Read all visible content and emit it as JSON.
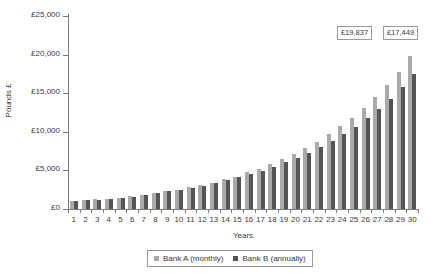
{
  "chart_data": {
    "type": "bar",
    "title": "",
    "xlabel": "Years",
    "ylabel": "Pounds £",
    "ylim": [
      0,
      25000
    ],
    "grid": false,
    "legend_position": "bottom",
    "ytick_labels": [
      "£25,000",
      "£20,000",
      "£15,000",
      "£10,000",
      "£5,000",
      "£0"
    ],
    "ytick_values": [
      25000,
      20000,
      15000,
      10000,
      5000,
      0
    ],
    "categories": [
      "1",
      "2",
      "3",
      "4",
      "5",
      "6",
      "7",
      "8",
      "9",
      "10",
      "11",
      "12",
      "13",
      "14",
      "15",
      "16",
      "17",
      "18",
      "19",
      "20",
      "21",
      "22",
      "23",
      "24",
      "25",
      "26",
      "27",
      "28",
      "29",
      "30"
    ],
    "series": [
      {
        "name": "Bank A (monthly)",
        "color": "#aaaaaa",
        "values": [
          1050,
          1130,
          1250,
          1310,
          1470,
          1650,
          1880,
          2100,
          2330,
          2520,
          2800,
          3080,
          3420,
          3880,
          4180,
          4750,
          5150,
          5800,
          6450,
          7150,
          7900,
          8700,
          9700,
          10750,
          11850,
          13100,
          14550,
          16100,
          17800,
          19837
        ]
      },
      {
        "name": "Bank B (annually)",
        "color": "#555555",
        "values": [
          1030,
          1110,
          1220,
          1290,
          1440,
          1620,
          1840,
          2060,
          2290,
          2480,
          2740,
          3020,
          3330,
          3760,
          4090,
          4500,
          4980,
          5450,
          6050,
          6620,
          7300,
          8050,
          8850,
          9700,
          10650,
          11750,
          12950,
          14300,
          15750,
          17449
        ]
      }
    ],
    "annotations": [
      {
        "text": "£19,837",
        "series": "Bank A (monthly)",
        "year": 30
      },
      {
        "text": "£17,449",
        "series": "Bank B (annually)",
        "year": 30
      }
    ]
  }
}
